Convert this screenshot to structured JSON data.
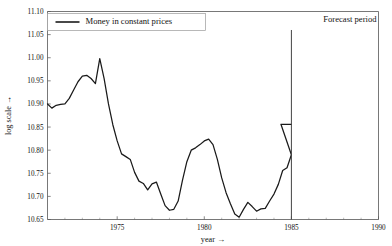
{
  "chart_data": {
    "type": "line",
    "title": "",
    "xlabel": "year →",
    "ylabel": "log scale →",
    "xlim": [
      1971.0,
      1990.0
    ],
    "ylim": [
      10.65,
      11.1
    ],
    "grid": false,
    "legend_position": "top-left",
    "x_ticks": [
      1975,
      1980,
      1985,
      1990
    ],
    "x_tick_labels": [
      "1975",
      "1980",
      "1985",
      "1990"
    ],
    "x_minor_tick_step": 1,
    "y_ticks": [
      10.65,
      10.7,
      10.75,
      10.8,
      10.85,
      10.9,
      10.95,
      11.0,
      11.05,
      11.1
    ],
    "y_tick_labels": [
      "10.65",
      "10.70",
      "10.75",
      "10.80",
      "10.85",
      "10.90",
      "10.95",
      "11.00",
      "11.05",
      "11.10"
    ],
    "series": [
      {
        "name": "Money in constant prices",
        "color": "#1a1a1a",
        "x": [
          1971.0,
          1971.25,
          1971.5,
          1971.75,
          1972.0,
          1972.25,
          1972.5,
          1972.75,
          1973.0,
          1973.25,
          1973.5,
          1973.75,
          1974.0,
          1974.25,
          1974.5,
          1974.75,
          1975.0,
          1975.25,
          1975.5,
          1975.75,
          1976.0,
          1976.25,
          1976.5,
          1976.75,
          1977.0,
          1977.25,
          1977.5,
          1977.75,
          1978.0,
          1978.25,
          1978.5,
          1978.75,
          1979.0,
          1979.25,
          1979.5,
          1979.75,
          1980.0,
          1980.25,
          1980.5,
          1980.75,
          1981.0,
          1981.25,
          1981.5,
          1981.75,
          1982.0,
          1982.25,
          1982.5,
          1982.75,
          1983.0,
          1983.25,
          1983.5,
          1983.75,
          1984.0,
          1984.25,
          1984.5,
          1984.75,
          1985.0
        ],
        "y": [
          10.9,
          10.891,
          10.897,
          10.899,
          10.9,
          10.912,
          10.93,
          10.948,
          10.96,
          10.962,
          10.955,
          10.944,
          10.998,
          10.955,
          10.9,
          10.855,
          10.82,
          10.792,
          10.786,
          10.78,
          10.752,
          10.733,
          10.728,
          10.714,
          10.727,
          10.731,
          10.705,
          10.68,
          10.67,
          10.672,
          10.69,
          10.735,
          10.775,
          10.8,
          10.805,
          10.812,
          10.82,
          10.824,
          10.812,
          10.78,
          10.74,
          10.708,
          10.684,
          10.662,
          10.655,
          10.672,
          10.687,
          10.678,
          10.668,
          10.673,
          10.674,
          10.69,
          10.705,
          10.726,
          10.756,
          10.762,
          10.79
        ]
      }
    ],
    "annotations": [
      {
        "name": "forecast-period",
        "label": "Forecast period",
        "x": 1985.0,
        "type": "vertical-divider-with-label",
        "line_top_value": 11.06
      }
    ],
    "tail_segment": {
      "note": "flat run to forecast boundary",
      "x": [
        1984.4,
        1985.0
      ],
      "y": [
        10.856,
        10.856
      ]
    }
  },
  "legend": {
    "entries": [
      {
        "label": "Money in constant prices",
        "color": "#1a1a1a"
      }
    ]
  },
  "axis": {
    "x_title": "year →",
    "y_title": "log scale →"
  },
  "colors": {
    "series": "#1a1a1a",
    "frame": "#555555",
    "divider": "#444444",
    "background": "#ffffff"
  }
}
